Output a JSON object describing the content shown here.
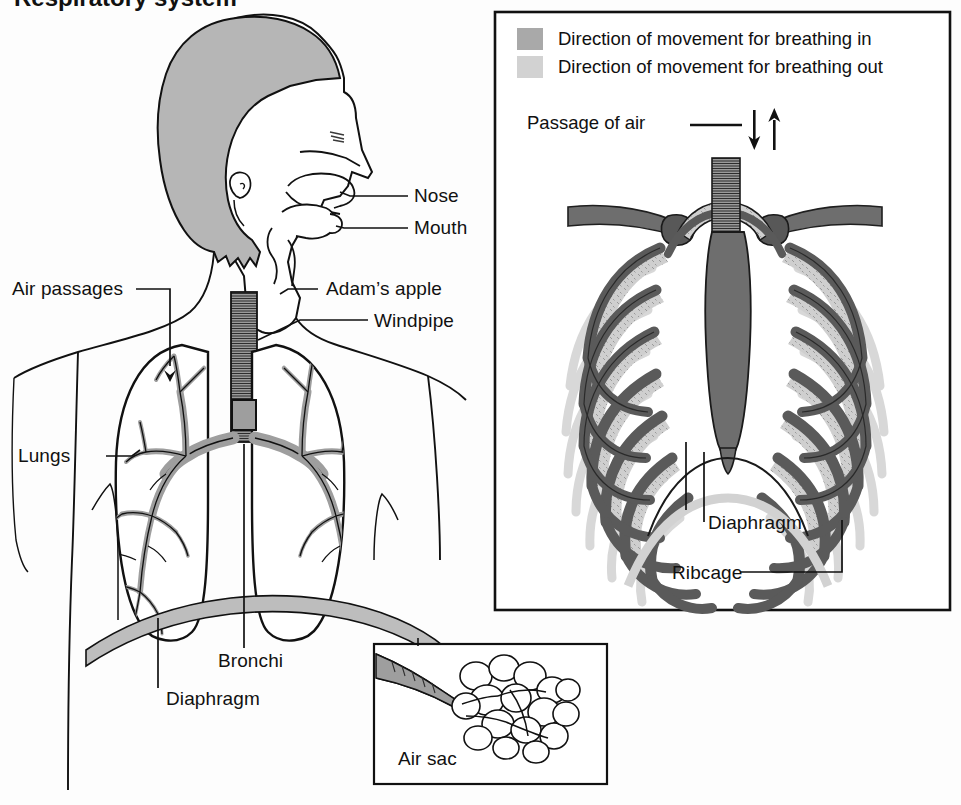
{
  "figure": {
    "title_fragment": "Respiratory system"
  },
  "left_panel": {
    "labels": [
      {
        "key": "nose",
        "text": "Nose"
      },
      {
        "key": "mouth",
        "text": "Mouth"
      },
      {
        "key": "adams_apple",
        "text": "Adam’s apple"
      },
      {
        "key": "windpipe",
        "text": "Windpipe"
      },
      {
        "key": "air_passages",
        "text": "Air passages"
      },
      {
        "key": "lungs",
        "text": "Lungs"
      },
      {
        "key": "bronchi",
        "text": "Bronchi"
      },
      {
        "key": "diaphragm",
        "text": "Diaphragm"
      }
    ]
  },
  "air_sac_inset": {
    "label": "Air sac"
  },
  "right_panel": {
    "legend": [
      {
        "key": "breathing_in",
        "text": "Direction of movement for breathing in",
        "color": "#a9a9a9"
      },
      {
        "key": "breathing_out",
        "text": "Direction of movement for breathing out",
        "color": "#d2d2d2"
      }
    ],
    "passage_label": "Passage of air",
    "labels": [
      {
        "key": "diaphragm",
        "text": "Diaphragm"
      },
      {
        "key": "ribcage",
        "text": "Ribcage"
      }
    ]
  },
  "colors": {
    "ink": "#111111",
    "hair_gray": "#b6b6b6",
    "bronchi_gray": "#a0a0a0",
    "diaphragm_gray": "#bdbdbd",
    "rib_dark": "#5a5a5a",
    "rib_fill": "#cfcfcf",
    "rib_shadow": "#d8d8d8",
    "sternum_gray": "#757575",
    "paper": "#fdfdfd"
  }
}
